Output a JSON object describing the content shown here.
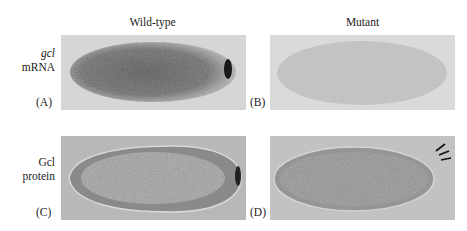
{
  "figure": {
    "columns": [
      {
        "label": "Wild-type"
      },
      {
        "label": "Mutant"
      }
    ],
    "rows": [
      {
        "label_italic": "gcl",
        "label_rest": "mRNA"
      },
      {
        "label_italic": "",
        "label_line1": "Gcl",
        "label_line2": "protein"
      }
    ],
    "panels": [
      {
        "letter": "(A)",
        "content": "wild-type embryo, gcl mRNA in situ, dark staining with strong posterior pole signal"
      },
      {
        "letter": "(B)",
        "content": "mutant embryo, gcl mRNA in situ, faint uniform staining, no posterior signal"
      },
      {
        "letter": "(C)",
        "content": "wild-type embryo, Gcl protein, posterior pole staining"
      },
      {
        "letter": "(D)",
        "content": "mutant embryo, Gcl protein absent at posterior, arrows indicate pole"
      }
    ],
    "colors": {
      "panel_bg": "#d4d4d4",
      "stain_dark": "#3a3a3a",
      "pole_stain": "#1a1a1a"
    }
  }
}
